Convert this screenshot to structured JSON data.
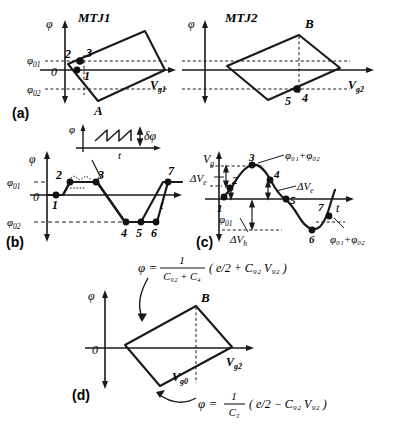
{
  "figure": {
    "type": "scientific-diagram",
    "line_color": "#1a1a1a",
    "dot_color": "#111111",
    "background": "#ffffff"
  },
  "panel_a": {
    "caption": "(a)",
    "left": {
      "title": "MTJ1",
      "y_axis_label": "φ",
      "x_axis_label": "V",
      "x_axis_sub": "g1",
      "ticks": [
        {
          "label": "φ",
          "sub": "01"
        },
        {
          "label": "0",
          "sub": ""
        },
        {
          "label": "φ",
          "sub": "02"
        }
      ],
      "vertex_labels": [
        "A"
      ],
      "point_labels": [
        "1",
        "2",
        "3"
      ]
    },
    "right": {
      "title": "MTJ2",
      "y_axis_label": "φ",
      "x_axis_label": "V",
      "x_axis_sub": "g2",
      "vertex_labels": [
        "B"
      ],
      "point_labels": [
        "4",
        "5"
      ]
    }
  },
  "panel_b": {
    "caption": "(b)",
    "y_axis_label": "φ",
    "x_axis_label": "t",
    "ticks": [
      {
        "label": "φ",
        "sub": "01"
      },
      {
        "label": "0",
        "sub": ""
      },
      {
        "label": "φ",
        "sub": "02"
      }
    ],
    "point_labels": [
      "1",
      "2",
      "3",
      "4",
      "5",
      "6",
      "7"
    ],
    "inset": {
      "y_axis_label": "φ",
      "x_axis_label": "t",
      "amplitude_label": "δφ",
      "waveform": "sawtooth"
    }
  },
  "panel_c": {
    "caption": "(c)",
    "y_axis_label": "V",
    "y_axis_sub": "g",
    "x_axis_label": "t",
    "point_labels": [
      "1",
      "2",
      "3",
      "4",
      "5",
      "6",
      "7"
    ],
    "annotations": [
      {
        "text": "ΔV",
        "sub": "e",
        "id": "delta-ve-left"
      },
      {
        "text": "ΔV",
        "sub": "e",
        "id": "delta-ve-right"
      },
      {
        "text": "ΔV",
        "sub": "h",
        "id": "delta-vh"
      },
      {
        "text": "φ",
        "sub": "01",
        "id": "phi01"
      },
      {
        "text": "φ₀₁+φ₀₂",
        "sub": "",
        "id": "phi-sum-top"
      },
      {
        "text": "φ₀₁+φ₀₂",
        "sub": "",
        "id": "phi-sum-bottom"
      }
    ]
  },
  "panel_d": {
    "caption": "(d)",
    "y_axis_label": "φ",
    "x_axis_label": "V",
    "x_axis_sub": "g2",
    "origin_label": "0",
    "vertex_labels": [
      "B"
    ],
    "dashed_label": "V",
    "dashed_sub": "g0",
    "equation_top": {
      "lhs": "φ =",
      "frac_num": "1",
      "frac_den": "C₉₂ + C₄",
      "paren": "( e/2 + C₉₂ V₉₂ )",
      "plain": "φ = 1/(C_g2 + C_4) ( e/2 + C_g2 V_g2 )"
    },
    "equation_bottom": {
      "lhs": "φ =",
      "frac_num": "1",
      "frac_den": "C₃",
      "paren": "( e/2 − C₉₂ V₉₂ )",
      "plain": "φ = 1/C_3 ( e/2 − C_g2 V_g2 )"
    }
  }
}
